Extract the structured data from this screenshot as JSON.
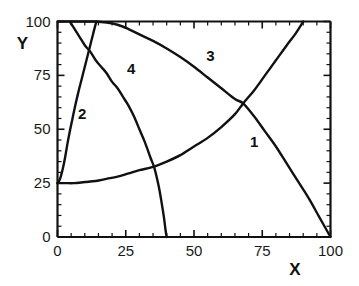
{
  "chart_data": {
    "type": "line",
    "title": "",
    "xlabel": "X",
    "ylabel": "Y",
    "xlim": [
      0,
      100
    ],
    "ylim": [
      0,
      100
    ],
    "xticks": [
      0,
      25,
      50,
      75,
      100
    ],
    "yticks": [
      0,
      25,
      50,
      75,
      100
    ],
    "xtick_labels": [
      "0",
      "25",
      "50",
      "75",
      "100"
    ],
    "ytick_labels": [
      "0",
      "25",
      "50",
      "75",
      "100"
    ],
    "minor_tick_step": 5,
    "grid": false,
    "legend": "inline-curve-numbers",
    "line_color": "#111111",
    "background": "#ffffff",
    "series": [
      {
        "name": "1",
        "label": "1",
        "label_x": 72,
        "label_y": 44,
        "points": [
          [
            0,
            25
          ],
          [
            3,
            25
          ],
          [
            6,
            25
          ],
          [
            10,
            25.5
          ],
          [
            14,
            26
          ],
          [
            18,
            27
          ],
          [
            22,
            28
          ],
          [
            26,
            29.5
          ],
          [
            30,
            31
          ],
          [
            35,
            32.5
          ],
          [
            40,
            35
          ],
          [
            45,
            38
          ],
          [
            50,
            42
          ],
          [
            55,
            46
          ],
          [
            60,
            51
          ],
          [
            65,
            57
          ],
          [
            68,
            62
          ],
          [
            72,
            68
          ],
          [
            76,
            75
          ],
          [
            80,
            82
          ],
          [
            84,
            89
          ],
          [
            87,
            94
          ],
          [
            90,
            100
          ]
        ]
      },
      {
        "name": "2",
        "label": "2",
        "label_x": 9,
        "label_y": 57,
        "points": [
          [
            0,
            25
          ],
          [
            0.6,
            26
          ],
          [
            1.2,
            28
          ],
          [
            2,
            32
          ],
          [
            2.8,
            37
          ],
          [
            3.6,
            43
          ],
          [
            4.5,
            49
          ],
          [
            5.5,
            55
          ],
          [
            6.5,
            61
          ],
          [
            7.6,
            67
          ],
          [
            8.8,
            73
          ],
          [
            10,
            79
          ],
          [
            11,
            84
          ],
          [
            12,
            89
          ],
          [
            13,
            94
          ],
          [
            13.8,
            98
          ],
          [
            14.3,
            100
          ]
        ]
      },
      {
        "name": "3",
        "label": "3",
        "label_x": 56,
        "label_y": 84,
        "points": [
          [
            0,
            100
          ],
          [
            5,
            100
          ],
          [
            10,
            100
          ],
          [
            14,
            100
          ],
          [
            18,
            99.5
          ],
          [
            22,
            98.5
          ],
          [
            26,
            96.5
          ],
          [
            30,
            94
          ],
          [
            35,
            91
          ],
          [
            40,
            87.5
          ],
          [
            45,
            83.5
          ],
          [
            50,
            79
          ],
          [
            55,
            74
          ],
          [
            60,
            69
          ],
          [
            65,
            64
          ],
          [
            68,
            62
          ],
          [
            72,
            56
          ],
          [
            76,
            49
          ],
          [
            80,
            42
          ],
          [
            84,
            34
          ],
          [
            88,
            26
          ],
          [
            92,
            18
          ],
          [
            96,
            9
          ],
          [
            100,
            0
          ]
        ]
      },
      {
        "name": "4",
        "label": "4",
        "label_x": 27,
        "label_y": 78,
        "points": [
          [
            4.5,
            100
          ],
          [
            6,
            97
          ],
          [
            8,
            93
          ],
          [
            10,
            89
          ],
          [
            12,
            86
          ],
          [
            14,
            82
          ],
          [
            16,
            79
          ],
          [
            18,
            76
          ],
          [
            20,
            72
          ],
          [
            22,
            69
          ],
          [
            24,
            65
          ],
          [
            26,
            61
          ],
          [
            28,
            56
          ],
          [
            30,
            50
          ],
          [
            32,
            44
          ],
          [
            34,
            37
          ],
          [
            35.5,
            32
          ],
          [
            37,
            24
          ],
          [
            38,
            17
          ],
          [
            39,
            9
          ],
          [
            39.6,
            3
          ],
          [
            40,
            0
          ]
        ]
      }
    ]
  }
}
